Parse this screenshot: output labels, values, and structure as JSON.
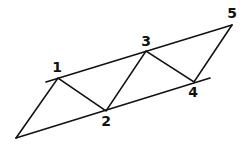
{
  "diagram": {
    "type": "zigzag-between-parallel-lines",
    "stroke_color": "#111111",
    "background": "#ffffff",
    "vertices": {
      "A": {
        "x": 16,
        "y": 138
      },
      "p1": {
        "x": 58,
        "y": 78
      },
      "p2": {
        "x": 106,
        "y": 111
      },
      "p3": {
        "x": 146,
        "y": 51
      },
      "p4": {
        "x": 194,
        "y": 82
      },
      "p5": {
        "x": 232,
        "y": 25
      }
    },
    "parallel_lines": {
      "upper": {
        "x1": 46,
        "y1": 82,
        "x2": 232,
        "y2": 25
      },
      "lower": {
        "x1": 16,
        "y1": 138,
        "x2": 210,
        "y2": 78
      }
    },
    "labels": [
      {
        "text": "1",
        "x": 57,
        "y": 72
      },
      {
        "text": "2",
        "x": 106,
        "y": 126
      },
      {
        "text": "3",
        "x": 146,
        "y": 46
      },
      {
        "text": "4",
        "x": 193,
        "y": 97
      },
      {
        "text": "5",
        "x": 232,
        "y": 18
      }
    ]
  }
}
